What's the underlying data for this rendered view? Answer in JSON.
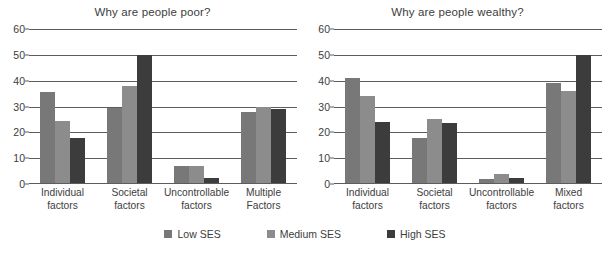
{
  "chart_data": [
    {
      "type": "bar",
      "title": "Why are people poor?",
      "xlabel": "",
      "ylabel": "",
      "ylim": [
        0,
        60
      ],
      "yticks": [
        0,
        10,
        20,
        30,
        40,
        50,
        60
      ],
      "grid": true,
      "legend_position": "bottom",
      "categories": [
        "Individual factors",
        "Societal factors",
        "Uncontrollable factors",
        "Multiple Factors"
      ],
      "category_lines": [
        [
          "Individual",
          "factors"
        ],
        [
          "Societal",
          "factors"
        ],
        [
          "Uncontrollable",
          "factors"
        ],
        [
          "Multiple",
          "Factors"
        ]
      ],
      "series": [
        {
          "name": "Low SES",
          "color": "#787878",
          "values": [
            35.5,
            29.5,
            7,
            28
          ]
        },
        {
          "name": "Medium SES",
          "color": "#8c8c8c",
          "values": [
            24.5,
            38,
            7,
            30
          ]
        },
        {
          "name": "High SES",
          "color": "#3c3c3c",
          "values": [
            18,
            50,
            2.5,
            29
          ]
        }
      ]
    },
    {
      "type": "bar",
      "title": "Why are people wealthy?",
      "xlabel": "",
      "ylabel": "",
      "ylim": [
        0,
        60
      ],
      "yticks": [
        0,
        10,
        20,
        30,
        40,
        50,
        60
      ],
      "grid": true,
      "legend_position": "bottom",
      "categories": [
        "Individual factors",
        "Societal factors",
        "Uncontrollable factors",
        "Mixed factors"
      ],
      "category_lines": [
        [
          "Individual",
          "factors"
        ],
        [
          "Societal",
          "factors"
        ],
        [
          "Uncontrollable",
          "factors"
        ],
        [
          "Mixed",
          "factors"
        ]
      ],
      "series": [
        {
          "name": "Low SES",
          "color": "#787878",
          "values": [
            41,
            18,
            2,
            39
          ]
        },
        {
          "name": "Medium SES",
          "color": "#8c8c8c",
          "values": [
            34,
            25,
            4,
            36
          ]
        },
        {
          "name": "High SES",
          "color": "#3c3c3c",
          "values": [
            24,
            23.5,
            2.5,
            50
          ]
        }
      ]
    }
  ],
  "legend": [
    {
      "label": "Low SES",
      "color": "#787878"
    },
    {
      "label": "Medium SES",
      "color": "#8c8c8c"
    },
    {
      "label": "High SES",
      "color": "#3c3c3c"
    }
  ]
}
